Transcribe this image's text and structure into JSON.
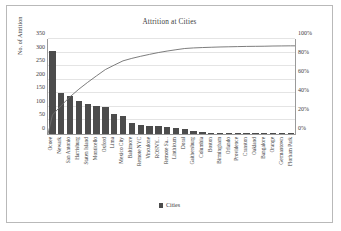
{
  "chart_data": {
    "type": "bar",
    "title": "Attrition at Cities",
    "xlabel": "",
    "ylabel": "No. of Attrition",
    "y2label": "",
    "ylim": [
      0,
      350
    ],
    "y2lim": [
      0,
      100
    ],
    "yticks": [
      "0",
      "50",
      "100",
      "150",
      "200",
      "250",
      "300",
      "350"
    ],
    "y2ticks": [
      "0%",
      "20%",
      "40%",
      "60%",
      "80%",
      "100%"
    ],
    "grid": true,
    "legend_position": "bottom",
    "legend": [
      "Cities"
    ],
    "bar_color": "#4c4c4c",
    "line_color": "#6e6e6e",
    "categories": [
      "Ocoee",
      "Newark",
      "San Antonio",
      "Harrisburg",
      "Staten Island",
      "Monticello",
      "Oxford",
      "Lima",
      "Mexico City",
      "Baltimore",
      "Remote NYC",
      "Vinculone",
      "ROSNY...",
      "Remote Sa...",
      "Linthicum",
      "Doral",
      "Gaithersburg",
      "Columbia",
      "Boston",
      "Birmingham",
      "Orlando",
      "Providence",
      "Cranston",
      "Oakland",
      "Bangalore",
      "Orange",
      "Germantown",
      "Florham Park"
    ],
    "series": [
      {
        "name": "Cities",
        "type": "bar",
        "values": [
          305,
          152,
          140,
          122,
          110,
          104,
          100,
          72,
          68,
          40,
          34,
          31,
          28,
          25,
          22,
          19,
          10,
          6,
          5,
          4,
          4,
          3,
          3,
          2,
          2,
          2,
          1,
          1
        ]
      },
      {
        "name": "Cumulative %",
        "type": "line",
        "values": [
          20.0,
          30.0,
          39.2,
          47.2,
          54.4,
          61.2,
          67.8,
          72.5,
          77.0,
          79.6,
          81.8,
          83.8,
          85.7,
          87.3,
          88.7,
          90.0,
          90.6,
          91.0,
          91.3,
          91.6,
          91.8,
          92.0,
          92.2,
          92.3,
          92.4,
          92.6,
          92.7,
          92.8
        ]
      }
    ]
  },
  "legend": {
    "label": "Cities"
  }
}
